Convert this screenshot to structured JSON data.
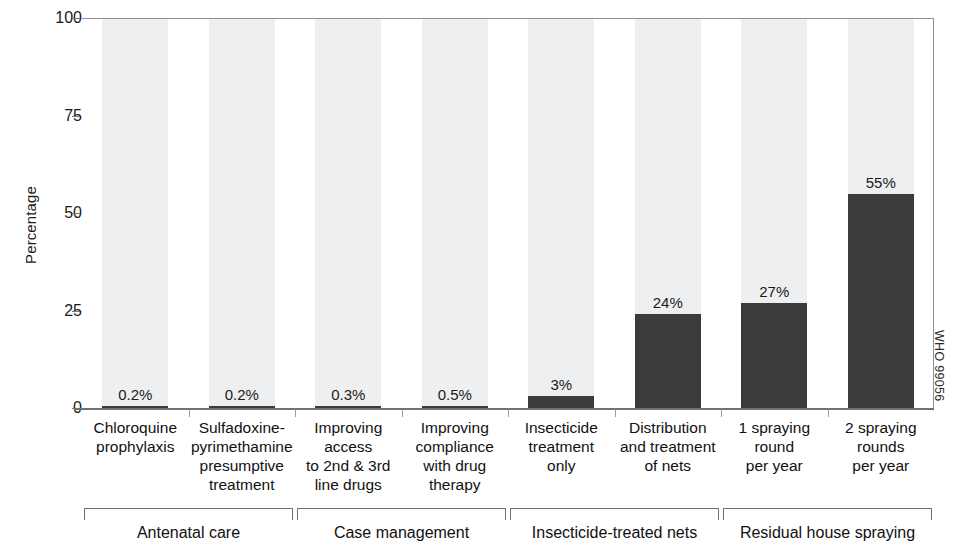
{
  "chart_data": {
    "type": "bar",
    "title": "",
    "subtitle": "",
    "xlabel": "",
    "ylabel": "Percentage",
    "ylim": [
      0,
      100
    ],
    "yticks": [
      0,
      25,
      50,
      75,
      100
    ],
    "ytick_labels": [
      "0",
      "25",
      "50",
      "75",
      "100"
    ],
    "grid": false,
    "legend": "none",
    "categories": [
      "Chloroquine prophylaxis",
      "Sulfadoxine-pyrimethamine presumptive treatment",
      "Improving access to 2nd & 3rd line drugs",
      "Improving compliance with drug therapy",
      "Insecticide treatment only",
      "Distribution and treatment of nets",
      "1 spraying round per year",
      "2 spraying rounds per year"
    ],
    "values": [
      0.2,
      0.2,
      0.3,
      0.5,
      3,
      24,
      27,
      55
    ],
    "value_labels": [
      "0.2%",
      "0.2%",
      "0.3%",
      "0.5%",
      "3%",
      "24%",
      "27%",
      "55%"
    ],
    "groups": [
      {
        "label": "Antenatal care",
        "categories": [
          0,
          1
        ]
      },
      {
        "label": "Case management",
        "categories": [
          2,
          3
        ]
      },
      {
        "label": "Insecticide-treated nets",
        "categories": [
          4,
          5
        ]
      },
      {
        "label": "Residual house spraying",
        "categories": [
          6,
          7
        ]
      }
    ],
    "colors": {
      "bar": "#3b3b3b",
      "band": "#eeeff0",
      "axis": "#8c8e90",
      "text": "#1a1a1a",
      "background": "#ffffff"
    }
  },
  "axis": {
    "y_title": "Percentage"
  },
  "category_lines": [
    [
      "Chloroquine",
      "prophylaxis"
    ],
    [
      "Sulfadoxine-",
      "pyrimethamine",
      "presumptive",
      "treatment"
    ],
    [
      "Improving",
      "access",
      "to 2nd & 3rd",
      "line drugs"
    ],
    [
      "Improving",
      "compliance",
      "with drug",
      "therapy"
    ],
    [
      "Insecticide",
      "treatment",
      "only"
    ],
    [
      "Distribution",
      "and treatment",
      "of nets"
    ],
    [
      "1 spraying",
      "round",
      "per year"
    ],
    [
      "2 spraying",
      "rounds",
      "per year"
    ]
  ],
  "credit": {
    "text": "WHO 99056"
  }
}
